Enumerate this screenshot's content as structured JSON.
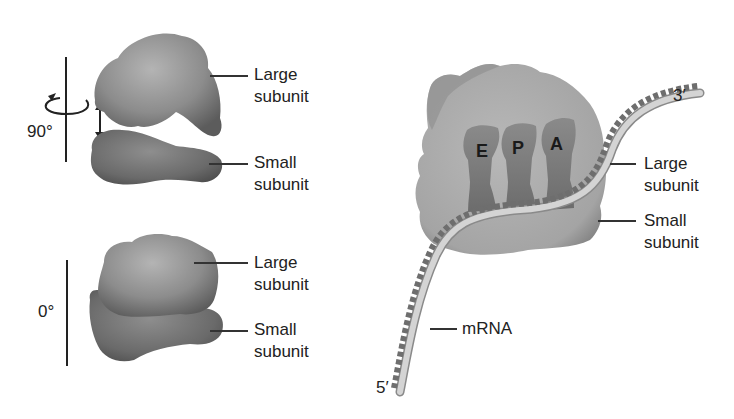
{
  "figure": {
    "left_panel": {
      "top_view": {
        "rotation_label": "90°",
        "large_label_line1": "Large",
        "large_label_line2": "subunit",
        "small_label_line1": "Small",
        "small_label_line2": "subunit"
      },
      "bottom_view": {
        "rotation_label": "0°",
        "large_label_line1": "Large",
        "large_label_line2": "subunit",
        "small_label_line1": "Small",
        "small_label_line2": "subunit"
      }
    },
    "right_panel": {
      "sites": [
        "E",
        "P",
        "A"
      ],
      "three_prime": "3′",
      "five_prime": "5′",
      "large_label_line1": "Large",
      "large_label_line2": "subunit",
      "small_label_line1": "Small",
      "small_label_line2": "subunit",
      "mrna_label": "mRNA"
    },
    "colors": {
      "large_subunit": "#8a8a8a",
      "small_subunit": "#6a6a6a",
      "ribosome_body": "#a8a8a8",
      "trna": "#7b7b7b",
      "mrna_strand": "#c8c8c8"
    }
  }
}
